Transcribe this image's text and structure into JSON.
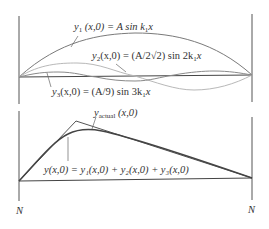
{
  "colors": {
    "axis": "#555555",
    "y1_curve": "#7a7a7a",
    "y2_curve": "#b8b8b8",
    "y3_curve": "#8a8a8a",
    "actual": "#555555",
    "sum": "#444444",
    "text": "#333333"
  },
  "top_panel": {
    "labels": {
      "y1": {
        "var": "y",
        "sub": "1",
        "rest": " (x,0) = A sin k",
        "sub2": "1",
        "tail": "x"
      },
      "y2": {
        "var": "y",
        "sub": "2",
        "rest": "(x,0) = (A/2√2) sin 2k",
        "sub2": "1",
        "tail": "x"
      },
      "y3": {
        "var": "y",
        "sub": "3",
        "rest": "(x,0) = (A/9) sin 3k",
        "sub2": "1",
        "tail": "x"
      }
    }
  },
  "bottom_panel": {
    "labels": {
      "actual": {
        "var": "y",
        "sub": "actual",
        "rest": " (x,0)"
      },
      "sum": "y(x,0) = y₁(x,0) + y₂(x,0) +  y₃(x,0)"
    },
    "node_left": "N",
    "node_right": "N"
  }
}
